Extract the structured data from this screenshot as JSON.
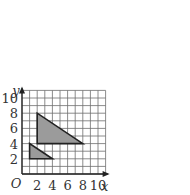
{
  "chart_data": {
    "type": "coordinate-grid-shapes",
    "title": "",
    "xlabel": "x",
    "ylabel": "y",
    "origin_label": "O",
    "xlim": [
      0,
      11
    ],
    "ylim": [
      0,
      11
    ],
    "grid": true,
    "grid_step": 1,
    "x_ticks": [
      2,
      4,
      6,
      8,
      10
    ],
    "y_ticks": [
      2,
      4,
      6,
      8,
      10
    ],
    "shapes": [
      {
        "name": "large-triangle",
        "type": "triangle",
        "vertices": [
          [
            2,
            4
          ],
          [
            2,
            8
          ],
          [
            8,
            4
          ]
        ],
        "fill": "#9b9b9b"
      },
      {
        "name": "small-triangle",
        "type": "triangle",
        "vertices": [
          [
            1,
            2
          ],
          [
            1,
            4
          ],
          [
            4,
            2
          ]
        ],
        "fill": "#9b9b9b"
      }
    ]
  },
  "colors": {
    "grid": "#6e6e6e",
    "axis": "#222222",
    "shape_fill": "#9b9b9b",
    "shape_stroke": "#222222",
    "text": "#333333"
  }
}
